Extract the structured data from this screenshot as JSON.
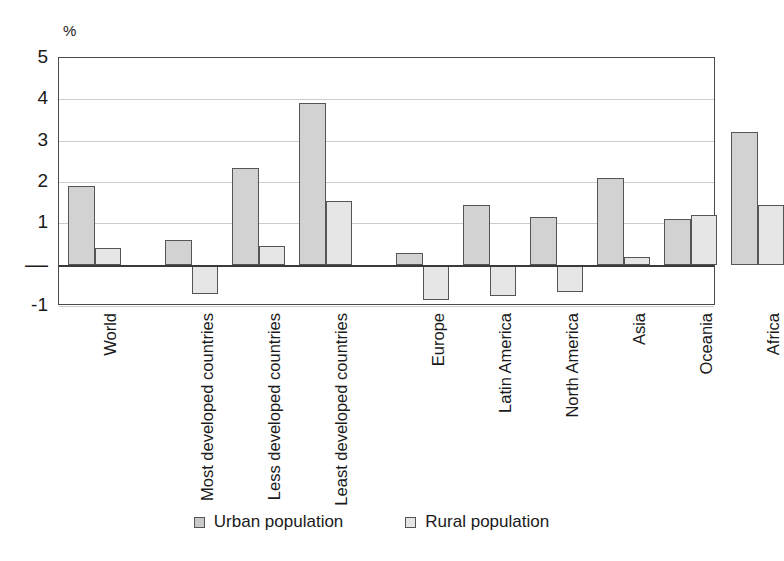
{
  "chart_data": {
    "type": "bar",
    "title": "",
    "subtitle": "",
    "xlabel": "",
    "ylabel": "%",
    "unit_label": "%",
    "ylim": [
      -1,
      5
    ],
    "yticks": [
      5,
      4,
      3,
      2,
      1,
      0,
      -1
    ],
    "ytick_labels": [
      "5",
      "4",
      "3",
      "2",
      "1",
      "—",
      "-1"
    ],
    "grid": true,
    "grid_axis": "y",
    "legend_position": "bottom-center",
    "categories": [
      "World",
      "Most developed countries",
      "Less developed countries",
      "Least developed countries",
      "Europe",
      "Latin America",
      "North America",
      "Asia",
      "Oceania",
      "Africa"
    ],
    "series": [
      {
        "name": "Urban population",
        "color": "#d2d2d2",
        "values": [
          1.9,
          0.6,
          2.35,
          3.9,
          0.28,
          1.45,
          1.15,
          2.1,
          1.1,
          3.2
        ]
      },
      {
        "name": "Rural population",
        "color": "#e6e6e6",
        "values": [
          0.4,
          -0.7,
          0.45,
          1.55,
          -0.85,
          -0.75,
          -0.65,
          0.18,
          1.2,
          1.45
        ]
      }
    ],
    "group_gap_after": [
      0,
      3
    ],
    "annotations": []
  },
  "legend": {
    "items": [
      {
        "label": "Urban population",
        "swatch": "urban"
      },
      {
        "label": "Rural population",
        "swatch": "rural"
      }
    ]
  }
}
